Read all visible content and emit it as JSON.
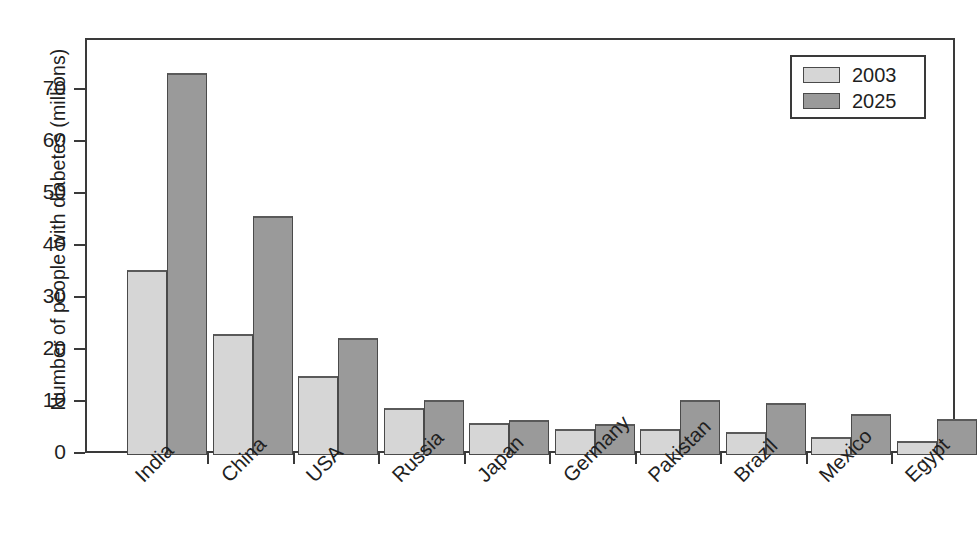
{
  "chart_data": {
    "type": "bar",
    "title": "",
    "subtitle": "",
    "xlabel": "",
    "ylabel": "Number of people with diabetes (millions)",
    "ylim": [
      0,
      78
    ],
    "yticks": [
      0,
      10,
      20,
      30,
      40,
      50,
      60,
      70
    ],
    "ytick_labels": [
      "0",
      "10",
      "20",
      "30",
      "40",
      "50",
      "60",
      "70"
    ],
    "grid": false,
    "legend_position": "top-right",
    "categories": [
      "India",
      "China",
      "USA",
      "Russia",
      "Japan",
      "Germany",
      "Pakistan",
      "Brazil",
      "Mexico",
      "Egypt"
    ],
    "series": [
      {
        "name": "2003",
        "color": "#d6d6d6",
        "values": [
          35.5,
          23.2,
          15.2,
          9.0,
          6.1,
          5.0,
          5.0,
          4.4,
          3.4,
          2.6
        ]
      },
      {
        "name": "2025",
        "color": "#9a9a9a",
        "values": [
          73.5,
          46.0,
          22.5,
          10.5,
          6.8,
          5.9,
          10.5,
          10.0,
          7.9,
          6.9
        ]
      }
    ]
  },
  "legend": {
    "items": [
      {
        "label": "2003",
        "series": "a"
      },
      {
        "label": "2025",
        "series": "b"
      }
    ]
  },
  "colors": {
    "series_2003": "#d6d6d6",
    "series_2025": "#9a9a9a",
    "axis": "#3a3a3a",
    "text": "#1f1f1f",
    "background": "#ffffff"
  }
}
